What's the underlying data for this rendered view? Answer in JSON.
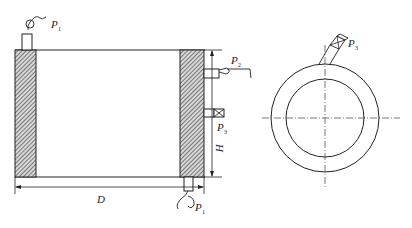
{
  "diagram": {
    "side_view": {
      "labels": {
        "p1_top": "P",
        "p1_top_sub": "1",
        "p2": "P",
        "p2_sub": "2",
        "p3": "P",
        "p3_sub": "3",
        "p1_bottom": "P",
        "p1_bottom_sub": "1",
        "height": "H",
        "diameter": "D"
      }
    },
    "top_view": {
      "labels": {
        "p3": "P",
        "p3_sub": "3"
      }
    },
    "colors": {
      "line": "#222222",
      "hatch": "#444444",
      "centerline": "#555555"
    }
  }
}
